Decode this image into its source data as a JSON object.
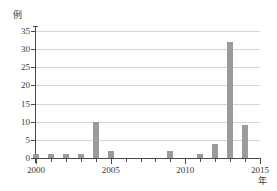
{
  "chart_data": {
    "type": "bar",
    "title": "",
    "subtitle": "",
    "xlabel": "年",
    "ylabel": "例",
    "categories": [
      2000,
      2001,
      2002,
      2003,
      2004,
      2005,
      2006,
      2007,
      2008,
      2009,
      2010,
      2011,
      2012,
      2013,
      2014
    ],
    "values": [
      1,
      1,
      1,
      1,
      10,
      2,
      0,
      0,
      0,
      2,
      0,
      1,
      4,
      32,
      9
    ],
    "series": [
      {
        "name": "例数",
        "values": [
          1,
          1,
          1,
          1,
          10,
          2,
          0,
          0,
          0,
          2,
          0,
          1,
          4,
          32,
          9
        ]
      }
    ],
    "xlim": [
      2000,
      2015
    ],
    "ylim": [
      0,
      35
    ],
    "ytick_labels": [
      "0",
      "5",
      "10",
      "15",
      "20",
      "25",
      "30",
      "35"
    ],
    "ytick_values": [
      0,
      5,
      10,
      15,
      20,
      25,
      30,
      35
    ],
    "xtick_labels": [
      "2000",
      "2005",
      "2010",
      "2015"
    ],
    "xtick_values": [
      2000,
      2005,
      2010,
      2015
    ],
    "xtick_minor_values": [
      2001,
      2002,
      2003,
      2004,
      2006,
      2007,
      2008,
      2009,
      2011,
      2012,
      2013,
      2014
    ],
    "grid": "horizontal",
    "legend": "none",
    "bar_color": "#9b9b9b",
    "axis_color": "#4a4a4a",
    "grid_color": "#d6d6d6",
    "background_color": "#ffffff"
  }
}
